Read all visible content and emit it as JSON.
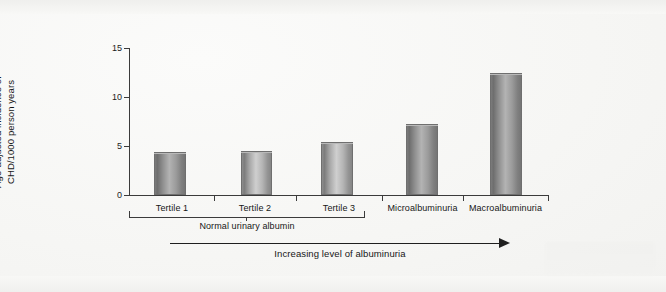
{
  "chart_data": {
    "type": "bar",
    "title": "",
    "categories": [
      "Tertile 1",
      "Tertile 2",
      "Tertile 3",
      "Microalbuminuria",
      "Macroalbuminuria"
    ],
    "values": [
      4.4,
      4.5,
      5.4,
      7.3,
      12.5
    ],
    "xlabel": "Increasing level of albuminuria",
    "ylabel": "Age-adjusted incidence of CHD/1000 person years",
    "ylim": [
      0,
      15
    ],
    "yticks": [
      "0",
      "5",
      "10",
      "15"
    ],
    "grid": false,
    "legend": "none",
    "annotations": [
      {
        "name": "group-bracket",
        "text": "Normal urinary albumin",
        "spans_categories": [
          "Tertile 1",
          "Tertile 2",
          "Tertile 3"
        ]
      },
      {
        "name": "direction-arrow",
        "text": "Increasing level of albuminuria",
        "direction": "right"
      }
    ],
    "colors": {
      "bar_fill_light": "#cfcfcf",
      "bar_fill_mid": "#a7a7a7",
      "bar_fill_dark": "#6e6e6e",
      "bar_outline": "#6f6f6f",
      "axis": "#3b3b3b",
      "text": "#161616",
      "background": "#f6f6f4"
    }
  },
  "axis": {
    "y_title_line1": "Age-adjusted incidence of",
    "y_title_line2": "CHD/1000 person years",
    "ticks": [
      {
        "label": "15",
        "value": 15
      },
      {
        "label": "10",
        "value": 10
      },
      {
        "label": "5",
        "value": 5
      },
      {
        "label": "0",
        "value": 0
      }
    ]
  },
  "bars": [
    {
      "label": "Tertile 1",
      "value": 4.4,
      "shade": "dark"
    },
    {
      "label": "Tertile 2",
      "value": 4.5,
      "shade": "light"
    },
    {
      "label": "Tertile 3",
      "value": 5.4,
      "shade": "light"
    },
    {
      "label": "Microalbuminuria",
      "value": 7.3,
      "shade": "dark"
    },
    {
      "label": "Macroalbuminuria",
      "value": 12.5,
      "shade": "dark"
    }
  ],
  "bracket": {
    "label": "Normal urinary albumin"
  },
  "arrow": {
    "label": "Increasing level of albuminuria"
  }
}
